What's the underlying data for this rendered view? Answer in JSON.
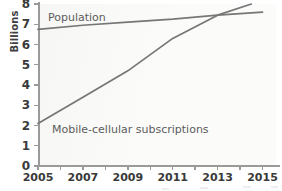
{
  "chart_data": {
    "type": "line",
    "title": "",
    "xlabel": "",
    "ylabel": "Billions",
    "xlim": [
      2005,
      2015.6
    ],
    "ylim": [
      0,
      8
    ],
    "yticks": [
      0,
      1,
      2,
      3,
      4,
      5,
      6,
      7,
      8
    ],
    "xticks": [
      2005,
      2006,
      2007,
      2008,
      2009,
      2010,
      2011,
      2012,
      2013,
      2014,
      2015
    ],
    "xtick_labels": [
      "2005",
      "2007",
      "2009",
      "2011",
      "2013",
      "2015"
    ],
    "xtick_labels_years": [
      2005,
      2007,
      2009,
      2011,
      2013,
      2015
    ],
    "grid": false,
    "legend": "inline-labels",
    "line_color": "#767676",
    "plot_background": "#fbfbfa",
    "series": [
      {
        "name": "Population",
        "label": "Population",
        "x": [
          2005,
          2007,
          2009,
          2011,
          2013,
          2015
        ],
        "values": [
          6.75,
          6.95,
          7.1,
          7.25,
          7.45,
          7.6
        ]
      },
      {
        "name": "Mobile-cellular subscriptions",
        "label": "Mobile-cellular subscriptions",
        "x": [
          2005,
          2007,
          2009,
          2011,
          2013,
          2014.5
        ],
        "values": [
          2.1,
          3.4,
          4.7,
          6.3,
          7.45,
          8.0
        ]
      }
    ]
  }
}
